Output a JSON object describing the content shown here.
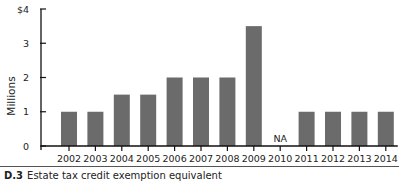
{
  "chart_data": {
    "type": "bar",
    "title": "",
    "xlabel": "",
    "ylabel": "Millions",
    "ylim": [
      0,
      4
    ],
    "yticks": [
      0,
      1,
      2,
      3,
      4
    ],
    "ytick_labels": [
      "0",
      "1",
      "2",
      "3",
      "$4"
    ],
    "grid": false,
    "legend": null,
    "categories": [
      "2002",
      "2003",
      "2004",
      "2005",
      "2006",
      "2007",
      "2008",
      "2009",
      "2010",
      "2011",
      "2012",
      "2013",
      "2014"
    ],
    "values": [
      1.0,
      1.0,
      1.5,
      1.5,
      2.0,
      2.0,
      2.0,
      3.5,
      null,
      1.0,
      1.0,
      1.0,
      1.0
    ],
    "annotations": [
      {
        "category": "2010",
        "text": "NA"
      }
    ],
    "bar_color": "#6b6b6b"
  },
  "caption": {
    "label": "D.3",
    "text": "Estate tax credit exemption equivalent"
  }
}
